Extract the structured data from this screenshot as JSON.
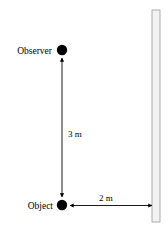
{
  "diagram": {
    "background_color": "#ffffff",
    "stroke_color": "#000000",
    "nodes": {
      "observer": {
        "label": "Observer",
        "marker": "filled-circle",
        "x": 62,
        "y": 50,
        "radius": 5.2,
        "label_x": 52,
        "label_y": 53,
        "label_anchor": "end"
      },
      "object": {
        "label": "Object",
        "marker": "filled-circle",
        "x": 62,
        "y": 205,
        "radius": 5.2,
        "label_x": 53,
        "label_y": 208,
        "label_anchor": "end"
      }
    },
    "wall": {
      "name": "mirror-wall",
      "x": 152,
      "y": 10,
      "width": 8,
      "height": 212,
      "fill_color": "#f2f2f2",
      "border_color": "#aaaaaa"
    },
    "measurements": [
      {
        "id": "vertical-distance",
        "label": "3 m",
        "value": 3,
        "unit": "m",
        "orientation": "vertical",
        "from_x": 62,
        "from_y": 58,
        "to_x": 62,
        "to_y": 197,
        "label_x": 68,
        "label_y": 137
      },
      {
        "id": "horizontal-distance",
        "label": "2 m",
        "value": 2,
        "unit": "m",
        "orientation": "horizontal",
        "from_x": 70,
        "from_y": 205,
        "to_x": 152,
        "to_y": 205,
        "label_x": 99,
        "label_y": 201
      }
    ]
  }
}
